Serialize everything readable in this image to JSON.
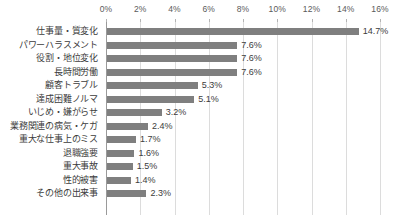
{
  "chart_data": {
    "type": "bar",
    "orientation": "horizontal",
    "title": "",
    "subtitle": "",
    "xlabel": "",
    "ylabel": "",
    "xlim": [
      0,
      16
    ],
    "xtick_step": 2,
    "grid": true,
    "legend": false,
    "value_suffix": "%",
    "axis_tick_labels": [
      "0%",
      "2%",
      "4%",
      "6%",
      "8%",
      "10%",
      "12%",
      "14%",
      "16%"
    ],
    "axis_tick_values": [
      0,
      2,
      4,
      6,
      8,
      10,
      12,
      14,
      16
    ],
    "categories": [
      "仕事量・質変化",
      "パワーハラスメント",
      "役割・地位変化",
      "長時間労働",
      "顧客トラブル",
      "達成困難ノルマ",
      "いじめ・嫌がらせ",
      "業務関連の病気・ケガ",
      "重大な仕事上のミス",
      "退職強要",
      "重大事故",
      "性的被害",
      "その他の出来事"
    ],
    "values": [
      14.7,
      7.6,
      7.6,
      7.6,
      5.3,
      5.1,
      3.2,
      2.4,
      1.7,
      1.6,
      1.5,
      1.4,
      2.3
    ],
    "value_labels": [
      "14.7%",
      "7.6%",
      "7.6%",
      "7.6%",
      "5.3%",
      "5.1%",
      "3.2%",
      "2.4%",
      "1.7%",
      "1.6%",
      "1.5%",
      "1.4%",
      "2.3%"
    ],
    "colors": {
      "bar": "#7f7f7f",
      "gridline": "#dcdcdc",
      "axis": "#9a9a9a",
      "text": "#3c3c3c",
      "tick_text": "#5a5a5a",
      "background": "#ffffff"
    }
  }
}
